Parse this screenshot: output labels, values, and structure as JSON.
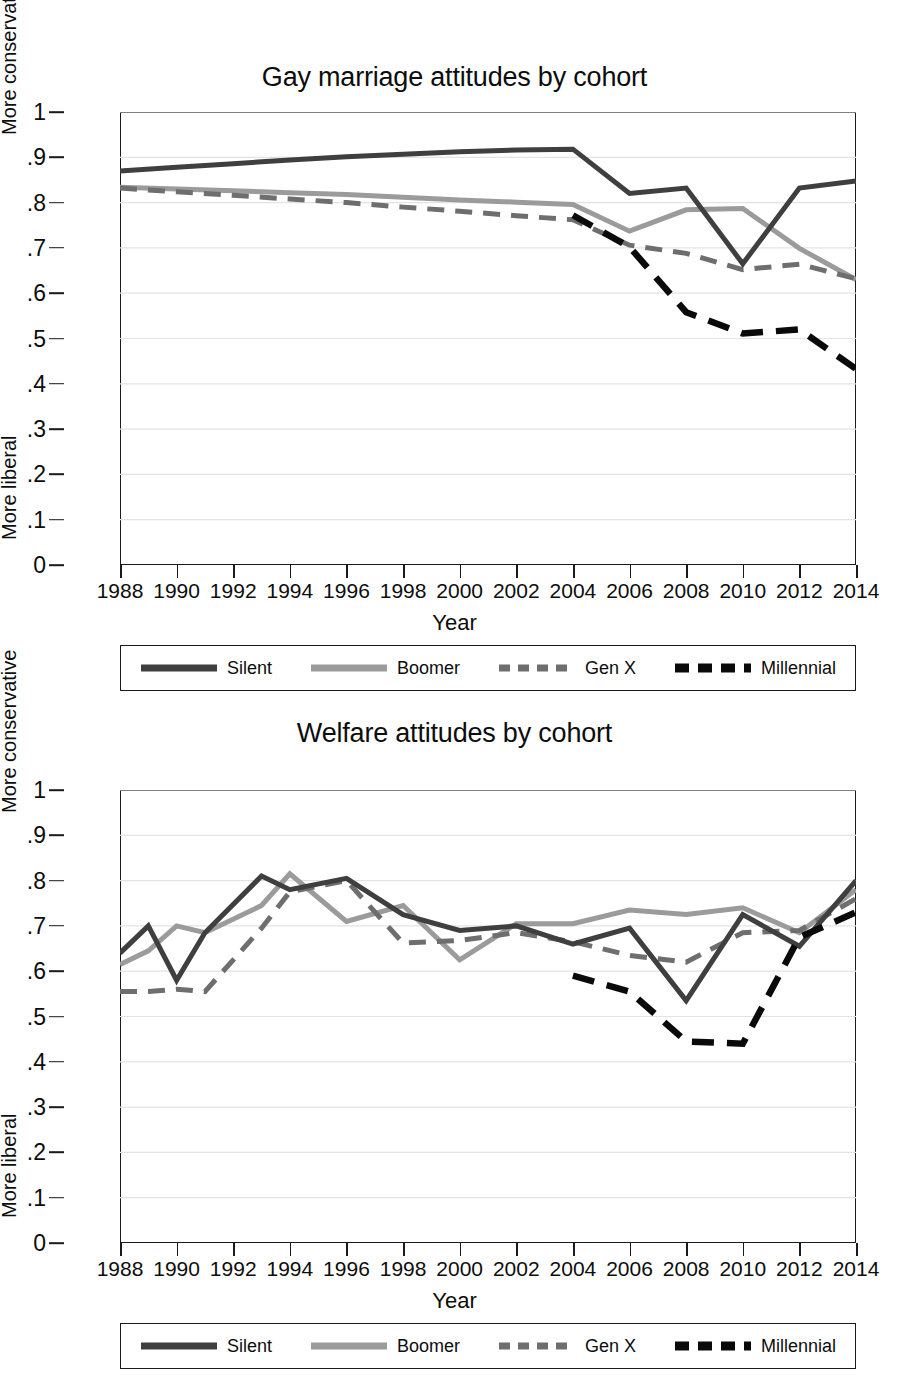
{
  "figure": {
    "xlabel": "Year",
    "y_upper_label": "More conservative",
    "y_lower_label": "More liberal"
  },
  "colors": {
    "silent": "#3f3f3f",
    "boomer": "#9b9b9b",
    "genx": "#6e6e6e",
    "millennial": "#0a0a0a",
    "axis": "#1a1a1a",
    "grid": "#e3e3e3",
    "background": "#ffffff"
  },
  "legend": {
    "items": [
      {
        "label": "Silent",
        "series": "silent",
        "style": "solid"
      },
      {
        "label": "Boomer",
        "series": "boomer",
        "style": "solid"
      },
      {
        "label": "Gen X",
        "series": "genx",
        "style": "dashed"
      },
      {
        "label": "Millennial",
        "series": "millennial",
        "style": "dashed"
      }
    ]
  },
  "axes": {
    "y_ticks": [
      "0",
      ".1",
      ".2",
      ".3",
      ".4",
      ".5",
      ".6",
      ".7",
      ".8",
      ".9",
      "1"
    ],
    "y_values": [
      0,
      0.1,
      0.2,
      0.3,
      0.4,
      0.5,
      0.6,
      0.7,
      0.8,
      0.9,
      1.0
    ],
    "x_ticks": [
      "1988",
      "1990",
      "1992",
      "1994",
      "1996",
      "1998",
      "2000",
      "2002",
      "2004",
      "2006",
      "2008",
      "2010",
      "2012",
      "2014"
    ],
    "x_values": [
      1988,
      1990,
      1992,
      1994,
      1996,
      1998,
      2000,
      2002,
      2004,
      2006,
      2008,
      2010,
      2012,
      2014
    ]
  },
  "chart_data": [
    {
      "type": "line",
      "title": "Gay marriage attitudes by cohort",
      "xlabel": "Year",
      "ylabel": "More liberal – More conservative",
      "xlim": [
        1988,
        2014
      ],
      "ylim": [
        0,
        1
      ],
      "grid": true,
      "legend_position": "below",
      "series": [
        {
          "name": "Silent",
          "style": "solid",
          "color": "#3f3f3f",
          "x": [
            1988,
            1990,
            1992,
            1994,
            1996,
            1998,
            2000,
            2002,
            2004,
            2006,
            2008,
            2010,
            2012,
            2014
          ],
          "values": [
            0.87,
            0.878,
            0.886,
            0.894,
            0.901,
            0.907,
            0.912,
            0.916,
            0.918,
            0.82,
            0.832,
            0.665,
            0.832,
            0.848
          ]
        },
        {
          "name": "Boomer",
          "style": "solid",
          "color": "#9b9b9b",
          "x": [
            1988,
            1990,
            1992,
            1994,
            1996,
            1998,
            2000,
            2002,
            2004,
            2006,
            2008,
            2010,
            2012,
            2014
          ],
          "values": [
            0.834,
            0.83,
            0.826,
            0.822,
            0.818,
            0.812,
            0.806,
            0.801,
            0.796,
            0.737,
            0.784,
            0.787,
            0.699,
            0.63
          ]
        },
        {
          "name": "Gen X",
          "style": "dashed",
          "color": "#6e6e6e",
          "x": [
            1988,
            1990,
            1992,
            1994,
            1996,
            1998,
            2000,
            2002,
            2004,
            2006,
            2008,
            2010,
            2012,
            2014
          ],
          "values": [
            0.832,
            0.824,
            0.816,
            0.808,
            0.8,
            0.79,
            0.781,
            0.771,
            0.762,
            0.706,
            0.688,
            0.652,
            0.664,
            0.632
          ]
        },
        {
          "name": "Millennial",
          "style": "dashed",
          "color": "#0a0a0a",
          "x": [
            2004,
            2006,
            2008,
            2010,
            2012,
            2014
          ],
          "values": [
            0.772,
            0.702,
            0.558,
            0.511,
            0.52,
            0.433
          ]
        }
      ]
    },
    {
      "type": "line",
      "title": "Welfare attitudes by cohort",
      "xlabel": "Year",
      "ylabel": "More liberal – More conservative",
      "xlim": [
        1988,
        2014
      ],
      "ylim": [
        0,
        1
      ],
      "grid": true,
      "legend_position": "below",
      "series": [
        {
          "name": "Silent",
          "style": "solid",
          "color": "#3f3f3f",
          "x": [
            1988,
            1989,
            1990,
            1991,
            1993,
            1994,
            1996,
            1998,
            2000,
            2002,
            2004,
            2006,
            2008,
            2010,
            2012,
            2014
          ],
          "values": [
            0.64,
            0.7,
            0.58,
            0.685,
            0.81,
            0.78,
            0.805,
            0.725,
            0.69,
            0.7,
            0.66,
            0.695,
            0.535,
            0.725,
            0.655,
            0.8
          ]
        },
        {
          "name": "Boomer",
          "style": "solid",
          "color": "#9b9b9b",
          "x": [
            1988,
            1989,
            1990,
            1991,
            1993,
            1994,
            1996,
            1998,
            2000,
            2002,
            2004,
            2006,
            2008,
            2010,
            2012,
            2014
          ],
          "values": [
            0.615,
            0.645,
            0.7,
            0.685,
            0.745,
            0.815,
            0.71,
            0.745,
            0.625,
            0.705,
            0.705,
            0.735,
            0.725,
            0.74,
            0.685,
            0.78
          ]
        },
        {
          "name": "Gen X",
          "style": "dashed",
          "color": "#6e6e6e",
          "x": [
            1988,
            1989,
            1990,
            1991,
            1993,
            1994,
            1996,
            1998,
            2000,
            2002,
            2004,
            2006,
            2008,
            2010,
            2012,
            2014
          ],
          "values": [
            0.555,
            0.555,
            0.56,
            0.555,
            0.695,
            0.775,
            0.8,
            0.662,
            0.668,
            0.685,
            0.665,
            0.635,
            0.62,
            0.685,
            0.69,
            0.76
          ]
        },
        {
          "name": "Millennial",
          "style": "dashed",
          "color": "#0a0a0a",
          "x": [
            2004,
            2006,
            2008,
            2010,
            2012,
            2014
          ],
          "values": [
            0.59,
            0.555,
            0.445,
            0.44,
            0.675,
            0.73
          ]
        }
      ]
    }
  ]
}
